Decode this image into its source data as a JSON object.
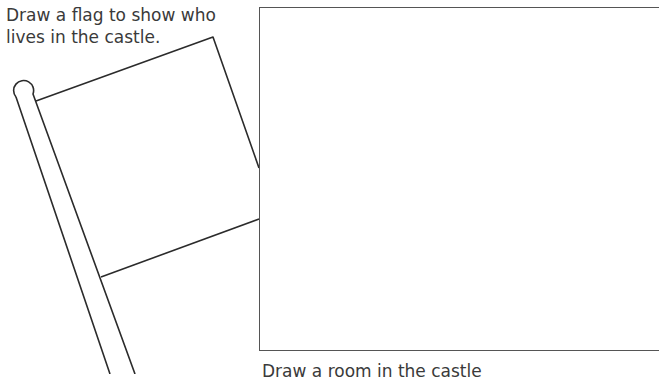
{
  "worksheet": {
    "flag_instruction": "Draw a flag to show who lives in the castle.",
    "room_instruction": "Draw a room in the castle"
  },
  "colors": {
    "line": "#2b2b2b",
    "box_border": "#555555",
    "text": "#3a3a3a"
  }
}
